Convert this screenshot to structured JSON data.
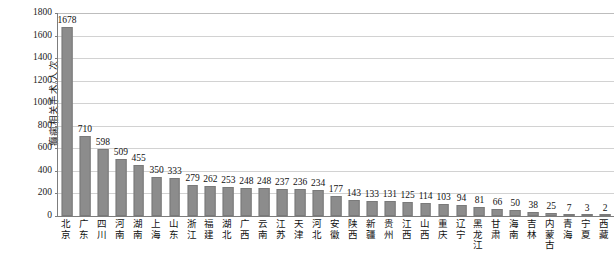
{
  "chart_data": {
    "type": "bar",
    "title": "",
    "xlabel": "",
    "ylabel": "癫痫相关手术/人次",
    "ylim": [
      0,
      1800
    ],
    "ytick_step": 200,
    "yticks": [
      0,
      200,
      400,
      600,
      800,
      1000,
      1200,
      1400,
      1600,
      1800
    ],
    "grid": true,
    "legend": false,
    "bar_color": "#8c8c8c",
    "bar_border_color": "#7a7a7a",
    "gridline_color": "#d2d2d2",
    "axis_color": "#7d7d7d",
    "categories": [
      "北京",
      "广东",
      "四川",
      "河南",
      "湖南",
      "上海",
      "山东",
      "浙江",
      "福建",
      "湖北",
      "广西",
      "云南",
      "江苏",
      "天津",
      "河北",
      "安徽",
      "陕西",
      "新疆",
      "贵州",
      "江西",
      "山西",
      "重庆",
      "辽宁",
      "黑龙江",
      "甘肃",
      "海南",
      "吉林",
      "内蒙古",
      "青海",
      "宁夏",
      "西藏"
    ],
    "values": [
      1678,
      710,
      598,
      509,
      455,
      350,
      333,
      279,
      262,
      253,
      248,
      248,
      237,
      236,
      234,
      177,
      143,
      133,
      131,
      125,
      114,
      103,
      94,
      81,
      66,
      50,
      38,
      25,
      7,
      3,
      2
    ]
  }
}
